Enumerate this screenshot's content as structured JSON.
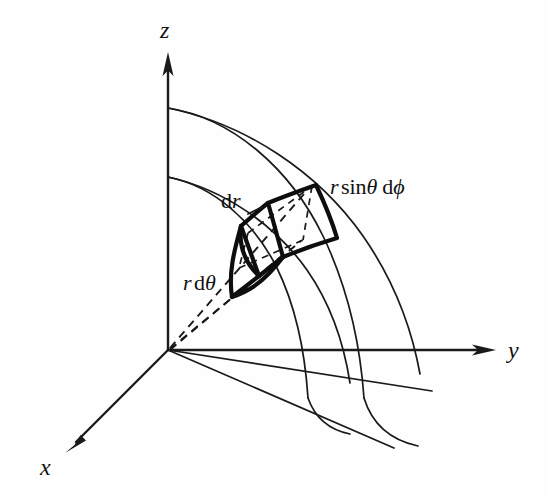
{
  "figure": {
    "background_color": "#fefefe",
    "ink_color": "#1a1a1a",
    "axes": [
      {
        "name": "z",
        "label": "z",
        "direction": "up",
        "origin": [
          168,
          350
        ],
        "tip": [
          168,
          55
        ]
      },
      {
        "name": "y",
        "label": "y",
        "direction": "right",
        "origin": [
          168,
          350
        ],
        "tip": [
          494,
          350
        ]
      },
      {
        "name": "x",
        "label": "x",
        "direction": "down-left",
        "origin": [
          168,
          350
        ],
        "tip": [
          66,
          452
        ]
      }
    ],
    "labels": {
      "z_axis": "z",
      "y_axis": "y",
      "x_axis": "x",
      "dr": {
        "d": "d",
        "r": "r",
        "full": "dr"
      },
      "r_dtheta": {
        "r": "r",
        "d": "d",
        "theta": "θ",
        "full": "r dθ"
      },
      "r_sin_theta_dphi": {
        "r": "r",
        "sin": "sin",
        "theta": "θ",
        "d": "d",
        "phi": "ϕ",
        "full": "r sinθ dϕ"
      }
    },
    "geometry": {
      "origin": [
        168,
        350
      ],
      "inner_radius_z_intercept": [
        168,
        177
      ],
      "outer_radius_z_intercept": [
        168,
        108
      ],
      "shell_count": 2,
      "meridian_curve_count": 4,
      "dashed_rays_from_origin": 3,
      "volume_element": {
        "style": "bold-outlined quadrilateral prism",
        "edge_width_px": 4.2,
        "edges_labelled": [
          "dr",
          "r dθ",
          "r sinθ dϕ"
        ]
      }
    }
  }
}
